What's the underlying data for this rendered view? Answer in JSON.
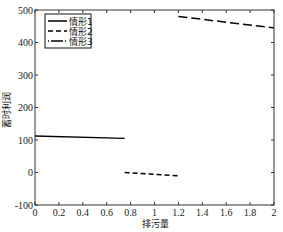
{
  "chart_data": {
    "type": "line",
    "title": "",
    "xlabel": "排污量",
    "ylabel": "蓄时利润",
    "xlim": [
      0,
      2
    ],
    "ylim": [
      -100,
      500
    ],
    "xticks": [
      0,
      0.2,
      0.4,
      0.6,
      0.8,
      1,
      1.2,
      1.4,
      1.6,
      1.8,
      2
    ],
    "xtick_labels": [
      "0",
      "0.2",
      "0.4",
      "0.6",
      "0.8",
      "1",
      "1.2",
      "1.4",
      "1.6",
      "1.8",
      "2"
    ],
    "yticks": [
      -100,
      0,
      100,
      200,
      300,
      400,
      500
    ],
    "ytick_labels": [
      "-100",
      "0",
      "100",
      "200",
      "300",
      "400",
      "500"
    ],
    "grid": false,
    "legend_position": "upper left",
    "series": [
      {
        "name": "情形1",
        "style": "solid",
        "color": "#000000",
        "x": [
          0,
          0.75
        ],
        "y": [
          112,
          105
        ]
      },
      {
        "name": "情形2",
        "style": "dashed",
        "color": "#000000",
        "x": [
          0.75,
          1.2
        ],
        "y": [
          0,
          -10
        ]
      },
      {
        "name": "情形3",
        "style": "dashdot",
        "color": "#000000",
        "x": [
          1.2,
          2.0
        ],
        "y": [
          480,
          445
        ]
      }
    ]
  }
}
